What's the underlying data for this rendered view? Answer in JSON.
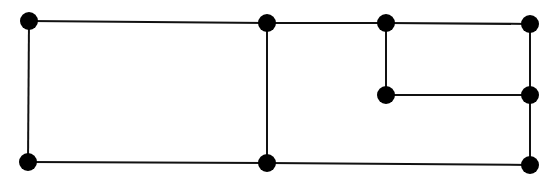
{
  "diagram": {
    "type": "graph",
    "width": 542,
    "height": 175,
    "stroke_color": "#111111",
    "node_color": "#000000",
    "node_radius": 9,
    "nodes": [
      {
        "id": "n1",
        "x": 29,
        "y": 21
      },
      {
        "id": "n2",
        "x": 267,
        "y": 23
      },
      {
        "id": "n3",
        "x": 386,
        "y": 23
      },
      {
        "id": "n4",
        "x": 530,
        "y": 24
      },
      {
        "id": "n5",
        "x": 386,
        "y": 95
      },
      {
        "id": "n6",
        "x": 530,
        "y": 95
      },
      {
        "id": "n7",
        "x": 28,
        "y": 162
      },
      {
        "id": "n8",
        "x": 267,
        "y": 163
      },
      {
        "id": "n9",
        "x": 530,
        "y": 165
      }
    ],
    "edges": [
      [
        "n1",
        "n2"
      ],
      [
        "n2",
        "n3"
      ],
      [
        "n3",
        "n4"
      ],
      [
        "n1",
        "n7"
      ],
      [
        "n2",
        "n8"
      ],
      [
        "n3",
        "n5"
      ],
      [
        "n5",
        "n6"
      ],
      [
        "n4",
        "n6"
      ],
      [
        "n6",
        "n9"
      ],
      [
        "n7",
        "n8"
      ],
      [
        "n8",
        "n9"
      ]
    ]
  }
}
